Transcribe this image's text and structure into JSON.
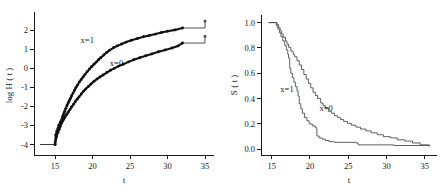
{
  "figure": {
    "background": "#ffffff",
    "panel_count": 2
  },
  "chart_data": [
    {
      "type": "line",
      "panel": "left",
      "title": "",
      "xlabel": "t",
      "ylabel": "log H ( t )",
      "xlim": [
        12.2,
        36.2
      ],
      "ylim": [
        -4.55,
        2.75
      ],
      "xticks": [
        15,
        20,
        25,
        30,
        35
      ],
      "xticklabels": [
        "15",
        "20",
        "25",
        "30",
        "35"
      ],
      "yticks": [
        -4,
        -3,
        -2,
        -1,
        0,
        1,
        2
      ],
      "yticklabels": [
        "-4",
        "-3",
        "-2",
        "-1",
        "0",
        "1",
        "2"
      ],
      "grid": false,
      "legend_position": "inline-annotation",
      "annotations": [
        {
          "text": "x=1",
          "x": 19.3,
          "y": 1.35
        },
        {
          "text": "x=0",
          "x": 23.2,
          "y": 0.12
        }
      ],
      "series": [
        {
          "name": "x=1",
          "marker": "filled-circle",
          "x": [
            13.0,
            15.0,
            15.1,
            15.25,
            15.4,
            15.5,
            15.6,
            15.7,
            15.8,
            15.9,
            16.0,
            16.1,
            16.2,
            16.3,
            16.45,
            16.6,
            16.75,
            16.9,
            17.05,
            17.2,
            17.4,
            17.6,
            17.8,
            18.0,
            18.25,
            18.5,
            18.75,
            19.0,
            19.3,
            19.6,
            19.9,
            20.2,
            20.5,
            20.8,
            21.1,
            21.5,
            21.9,
            22.3,
            22.8,
            23.3,
            23.9,
            24.5,
            25.2,
            26.0,
            26.8,
            27.6,
            28.4,
            29.2,
            30.0,
            31.0,
            32.0,
            35.0
          ],
          "y": [
            -4.0,
            -4.0,
            -3.5,
            -3.3,
            -3.15,
            -3.0,
            -2.95,
            -2.85,
            -2.78,
            -2.7,
            -2.55,
            -2.45,
            -2.35,
            -2.25,
            -2.1,
            -1.95,
            -1.82,
            -1.7,
            -1.58,
            -1.45,
            -1.3,
            -1.15,
            -1.0,
            -0.88,
            -0.72,
            -0.58,
            -0.45,
            -0.32,
            -0.17,
            -0.03,
            0.1,
            0.22,
            0.33,
            0.45,
            0.56,
            0.7,
            0.84,
            0.96,
            1.08,
            1.18,
            1.28,
            1.38,
            1.48,
            1.57,
            1.66,
            1.73,
            1.8,
            1.88,
            1.95,
            2.02,
            2.12,
            2.48
          ]
        },
        {
          "name": "x=0",
          "marker": "filled-circle",
          "x": [
            13.0,
            15.0,
            15.2,
            15.4,
            15.55,
            15.7,
            15.85,
            16.0,
            16.15,
            16.3,
            16.45,
            16.6,
            16.8,
            17.0,
            17.2,
            17.45,
            17.7,
            17.95,
            18.2,
            18.5,
            18.8,
            19.1,
            19.45,
            19.8,
            20.2,
            20.6,
            21.0,
            21.4,
            21.9,
            22.4,
            22.9,
            23.5,
            24.1,
            24.8,
            25.5,
            26.3,
            27.1,
            27.9,
            28.8,
            29.7,
            30.6,
            31.4,
            32.0,
            35.0
          ],
          "y": [
            -4.0,
            -4.0,
            -3.6,
            -3.35,
            -3.2,
            -3.05,
            -2.9,
            -2.78,
            -2.68,
            -2.58,
            -2.48,
            -2.4,
            -2.28,
            -2.16,
            -2.03,
            -1.9,
            -1.75,
            -1.62,
            -1.5,
            -1.35,
            -1.2,
            -1.08,
            -0.95,
            -0.82,
            -0.68,
            -0.56,
            -0.45,
            -0.35,
            -0.22,
            -0.1,
            0.0,
            0.12,
            0.22,
            0.34,
            0.45,
            0.56,
            0.66,
            0.76,
            0.87,
            0.97,
            1.07,
            1.18,
            1.33,
            1.68
          ]
        }
      ]
    },
    {
      "type": "line",
      "panel": "right",
      "title": "",
      "xlabel": "t",
      "ylabel": "S ( t )",
      "xlim": [
        13.6,
        36.6
      ],
      "ylim": [
        -0.045,
        1.06
      ],
      "xticks": [
        15,
        20,
        25,
        30,
        35
      ],
      "xticklabels": [
        "15",
        "20",
        "25",
        "30",
        "35"
      ],
      "yticks": [
        0.0,
        0.2,
        0.4,
        0.6,
        0.8,
        1.0
      ],
      "yticklabels": [
        "0.0",
        "0.2",
        "0.4",
        "0.6",
        "0.8",
        "1.0"
      ],
      "grid": false,
      "legend_position": "inline-annotation",
      "annotations": [
        {
          "text": "x=1",
          "x": 17.0,
          "y": 0.455
        },
        {
          "text": "x=0",
          "x": 22.1,
          "y": 0.3
        }
      ],
      "series": [
        {
          "name": "x=1",
          "style": "step",
          "x": [
            14.6,
            15.4,
            15.6,
            15.8,
            16.0,
            16.2,
            16.45,
            16.7,
            16.9,
            17.1,
            17.2,
            17.35,
            17.5,
            17.7,
            17.9,
            18.1,
            18.3,
            18.45,
            18.6,
            18.8,
            19.0,
            19.3,
            19.6,
            19.9,
            20.3,
            20.7,
            20.9,
            21.2,
            21.6,
            22.0,
            22.5,
            23.2,
            26.0,
            26.3,
            31.0,
            35.6
          ],
          "y": [
            1.0,
            1.0,
            0.975,
            0.95,
            0.92,
            0.89,
            0.855,
            0.82,
            0.785,
            0.75,
            0.72,
            0.64,
            0.6,
            0.565,
            0.53,
            0.495,
            0.46,
            0.42,
            0.36,
            0.32,
            0.285,
            0.25,
            0.225,
            0.2,
            0.185,
            0.17,
            0.105,
            0.09,
            0.08,
            0.07,
            0.06,
            0.055,
            0.05,
            0.035,
            0.03,
            0.028
          ]
        },
        {
          "name": "x=0",
          "style": "step",
          "x": [
            14.6,
            15.5,
            15.7,
            15.9,
            16.1,
            16.3,
            16.5,
            16.8,
            17.0,
            17.2,
            17.5,
            17.8,
            18.0,
            18.3,
            18.6,
            18.9,
            19.2,
            19.5,
            19.8,
            20.1,
            20.4,
            20.7,
            21.0,
            21.4,
            21.7,
            22.0,
            22.4,
            22.8,
            23.2,
            23.6,
            24.0,
            24.4,
            24.9,
            25.4,
            26.0,
            26.6,
            27.3,
            28.0,
            28.8,
            29.6,
            30.5,
            31.4,
            32.4,
            33.4,
            34.4,
            35.6
          ],
          "y": [
            1.0,
            1.0,
            0.985,
            0.96,
            0.935,
            0.91,
            0.885,
            0.855,
            0.83,
            0.805,
            0.775,
            0.75,
            0.73,
            0.7,
            0.665,
            0.63,
            0.59,
            0.555,
            0.52,
            0.485,
            0.45,
            0.425,
            0.4,
            0.365,
            0.345,
            0.325,
            0.3,
            0.285,
            0.265,
            0.25,
            0.235,
            0.22,
            0.205,
            0.19,
            0.175,
            0.16,
            0.145,
            0.13,
            0.115,
            0.1,
            0.09,
            0.075,
            0.065,
            0.05,
            0.035,
            0.022
          ]
        }
      ]
    }
  ]
}
